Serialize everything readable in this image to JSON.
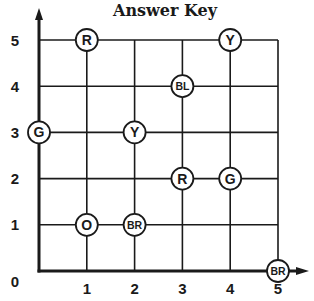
{
  "title": "Answer Key",
  "grid": {
    "x_range": [
      0,
      5
    ],
    "y_range": [
      0,
      5
    ],
    "x_ticks": [
      "1",
      "2",
      "3",
      "4",
      "5"
    ],
    "y_ticks": [
      "1",
      "2",
      "3",
      "4",
      "5"
    ],
    "origin_label": "0",
    "line_color": "#1a1a1a",
    "background": "#ffffff"
  },
  "points": [
    {
      "label": "R",
      "x": 1,
      "y": 5
    },
    {
      "label": "Y",
      "x": 4,
      "y": 5
    },
    {
      "label": "BL",
      "x": 3,
      "y": 4
    },
    {
      "label": "G",
      "x": 0,
      "y": 3
    },
    {
      "label": "Y",
      "x": 2,
      "y": 3
    },
    {
      "label": "R",
      "x": 3,
      "y": 2
    },
    {
      "label": "G",
      "x": 4,
      "y": 2
    },
    {
      "label": "O",
      "x": 1,
      "y": 1
    },
    {
      "label": "BR",
      "x": 2,
      "y": 1
    },
    {
      "label": "BR",
      "x": 5,
      "y": 0
    }
  ]
}
